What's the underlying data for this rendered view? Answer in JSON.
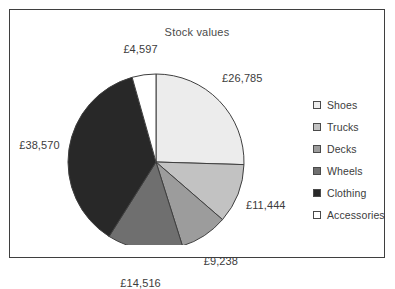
{
  "chart_data": {
    "type": "pie",
    "title": "Stock values",
    "currency_symbol": "£",
    "total": 105150,
    "categories": [
      "Shoes",
      "Trucks",
      "Decks",
      "Wheels",
      "Clothing",
      "Accessories"
    ],
    "values": [
      26785,
      11444,
      9238,
      14516,
      38570,
      4597
    ],
    "value_labels": [
      "£26,785",
      "£11,444",
      "£9,238",
      "£14,516",
      "£38,570",
      "£4,597"
    ],
    "slice_colors": [
      "#ececec",
      "#c2c2c2",
      "#9c9c9c",
      "#6f6f6f",
      "#282828",
      "#ffffff"
    ],
    "slice_border_color": "#3f3f3f",
    "legend_position": "right",
    "start_angle_deg": 0,
    "direction": "clockwise",
    "xlabel": "",
    "ylabel": ""
  },
  "frame": {
    "border_color": "#3f3f3f",
    "background": "#ffffff"
  },
  "legend": {
    "items": [
      {
        "label": "Shoes",
        "color": "#ececec"
      },
      {
        "label": "Trucks",
        "color": "#c2c2c2"
      },
      {
        "label": "Decks",
        "color": "#9c9c9c"
      },
      {
        "label": "Wheels",
        "color": "#6f6f6f"
      },
      {
        "label": "Clothing",
        "color": "#282828"
      },
      {
        "label": "Accessories",
        "color": "#ffffff"
      }
    ]
  }
}
